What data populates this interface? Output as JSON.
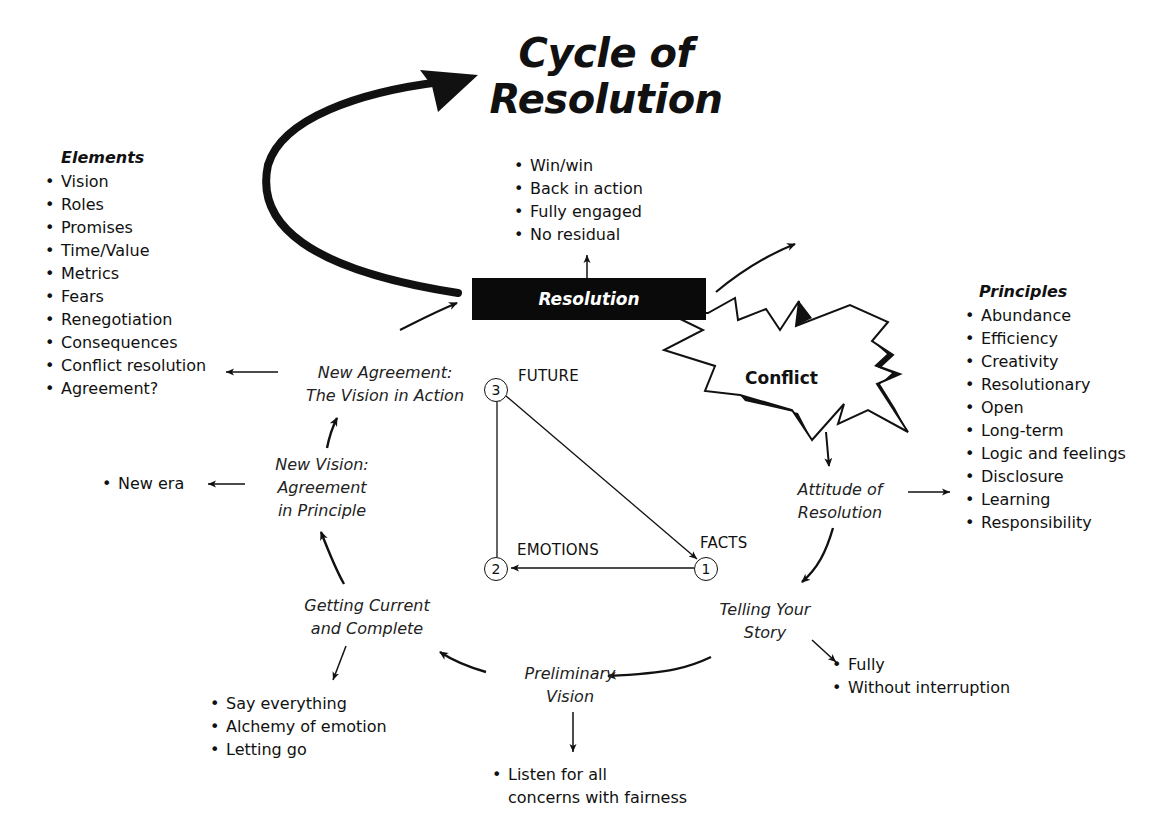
{
  "title": {
    "line1": "Cycle of",
    "line2": "Resolution"
  },
  "resolution_box": {
    "label": "Resolution"
  },
  "resolution_outcomes": [
    "Win/win",
    "Back in action",
    "Fully engaged",
    "No residual"
  ],
  "conflict": {
    "label": "Conflict"
  },
  "elements": {
    "heading": "Elements",
    "items": [
      "Vision",
      "Roles",
      "Promises",
      "Time/Value",
      "Metrics",
      "Fears",
      "Renegotiation",
      "Consequences",
      "Conflict resolution",
      "Agreement?"
    ]
  },
  "principles": {
    "heading": "Principles",
    "items": [
      "Abundance",
      "Efficiency",
      "Creativity",
      "Resolutionary",
      "Open",
      "Long-term",
      "Logic and feelings",
      "Disclosure",
      "Learning",
      "Responsibility"
    ]
  },
  "stages": {
    "attitude": {
      "line1": "Attitude of",
      "line2": "Resolution"
    },
    "telling": {
      "line1": "Telling Your",
      "line2": "Story"
    },
    "preliminary": {
      "line1": "Preliminary",
      "line2": "Vision"
    },
    "getting_current": {
      "line1": "Getting Current",
      "line2": "and Complete"
    },
    "new_vision": {
      "line1": "New Vision:",
      "line2": "Agreement",
      "line3": "in Principle"
    },
    "new_agreement": {
      "line1": "New Agreement:",
      "line2": "The Vision in Action"
    }
  },
  "stage_notes": {
    "telling": [
      "Fully",
      "Without interruption"
    ],
    "preliminary": [
      "Listen for all",
      "concerns with fairness"
    ],
    "getting_current": [
      "Say everything",
      "Alchemy of emotion",
      "Letting go"
    ],
    "new_vision": [
      "New era"
    ]
  },
  "triangle": {
    "nodes": [
      {
        "number": "1",
        "label": "FACTS"
      },
      {
        "number": "2",
        "label": "EMOTIONS"
      },
      {
        "number": "3",
        "label": "FUTURE"
      }
    ]
  },
  "colors": {
    "ink": "#111111",
    "box_fill": "#0a0a0a",
    "box_text": "#ffffff",
    "background": "#ffffff"
  }
}
